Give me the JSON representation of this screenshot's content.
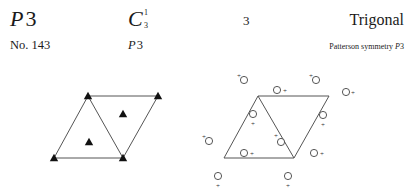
{
  "header": {
    "hm_symbol_letter": "P",
    "hm_symbol_number": "3",
    "number_label": "No. 143",
    "schoenflies_letter": "C",
    "schoenflies_superscript": "1",
    "schoenflies_subscript": "3",
    "short_symbol_letter": "P",
    "short_symbol_number": "3",
    "point_group": "3",
    "crystal_system": "Trigonal",
    "patterson_label": "Patterson symmetry ",
    "patterson_letter": "P",
    "patterson_number": "3"
  },
  "symmetry_diagram": {
    "cell_vertices": [
      [
        88,
        96
      ],
      [
        158,
        96
      ],
      [
        123,
        158
      ],
      [
        54,
        158
      ]
    ],
    "diagonal": [
      [
        88,
        96
      ],
      [
        123,
        158
      ]
    ],
    "threefold_axes": [
      [
        88,
        96
      ],
      [
        158,
        96
      ],
      [
        54,
        158
      ],
      [
        123,
        158
      ],
      [
        89,
        142
      ],
      [
        123,
        114
      ]
    ],
    "stroke_color": "#555555",
    "marker_color": "#111111"
  },
  "general_position_diagram": {
    "cell_vertices": [
      [
        258,
        96
      ],
      [
        329,
        96
      ],
      [
        294,
        158
      ],
      [
        224,
        158
      ]
    ],
    "diagonal": [
      [
        258,
        96
      ],
      [
        294,
        158
      ]
    ],
    "positions": [
      {
        "circle": [
          244,
          80
        ],
        "plus": [
          239,
          75
        ]
      },
      {
        "circle": [
          316,
          80
        ],
        "plus": [
          311,
          75
        ]
      },
      {
        "circle": [
          277,
          90
        ],
        "plus": [
          285,
          90
        ]
      },
      {
        "circle": [
          346,
          92
        ],
        "plus": [
          353,
          92
        ]
      },
      {
        "circle": [
          253,
          114
        ],
        "plus": [
          253,
          123
        ]
      },
      {
        "circle": [
          323,
          115
        ],
        "plus": [
          323,
          124
        ]
      },
      {
        "circle": [
          281,
          142
        ],
        "plus": [
          276,
          135
        ]
      },
      {
        "circle": [
          209,
          141
        ],
        "plus": [
          204,
          136
        ]
      },
      {
        "circle": [
          244,
          153
        ],
        "plus": [
          252,
          153
        ]
      },
      {
        "circle": [
          314,
          153
        ],
        "plus": [
          322,
          153
        ]
      },
      {
        "circle": [
          218,
          176
        ],
        "plus": [
          218,
          185
        ]
      },
      {
        "circle": [
          288,
          176
        ],
        "plus": [
          288,
          185
        ]
      }
    ],
    "plus_sign": "+",
    "stroke_color": "#555555"
  }
}
